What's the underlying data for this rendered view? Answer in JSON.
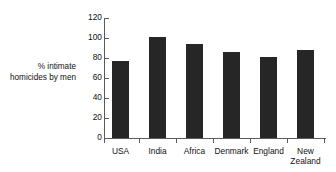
{
  "chart_data": {
    "type": "bar",
    "title": "",
    "subtitle": "",
    "xlabel": "",
    "ylabel": "% intimate\nhomicides by men",
    "ylabel_lines": [
      "% intimate",
      "homicides by men"
    ],
    "categories": [
      "USA",
      "India",
      "Africa",
      "Denmark",
      "England",
      "New Zealand"
    ],
    "category_label_lines": [
      [
        "USA"
      ],
      [
        "India"
      ],
      [
        "Africa"
      ],
      [
        "Denmark"
      ],
      [
        "England"
      ],
      [
        "New",
        "Zealand"
      ]
    ],
    "values": [
      77,
      101,
      94,
      86,
      81,
      88
    ],
    "ylim": [
      0,
      120
    ],
    "yticks": [
      0,
      20,
      40,
      60,
      80,
      100,
      120
    ],
    "ytick_labels": [
      "0",
      "20",
      "40",
      "60",
      "80",
      "100",
      "120"
    ],
    "grid": false,
    "legend": null,
    "legend_position": "none",
    "bar_color": "#262626",
    "axis_color": "#5b5b5b",
    "background_color": "#ffffff",
    "annotations": []
  }
}
